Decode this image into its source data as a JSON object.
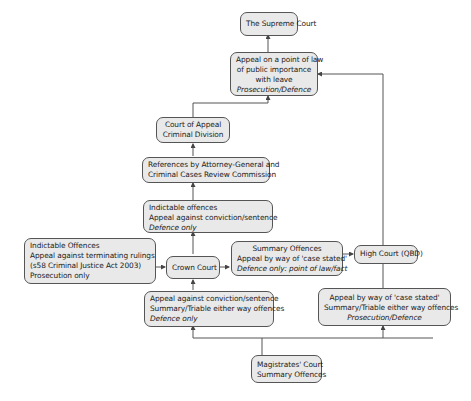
{
  "diagram": {
    "nodes": {
      "supreme_court": {
        "lines": [
          "The Supreme Court"
        ]
      },
      "point_of_law": {
        "lines": [
          "Appeal on a point of law",
          "of public importance",
          "with leave"
        ],
        "italic": "Prosecution/Defence"
      },
      "court_of_appeal": {
        "lines": [
          "Court of Appeal",
          "Criminal Division"
        ]
      },
      "references": {
        "lines": [
          "References by Attorney-General and",
          "Criminal Cases Review Commission"
        ]
      },
      "indictable_appeal": {
        "lines": [
          "Indictable offences",
          "Appeal against conviction/sentence"
        ],
        "italic": "Defence only"
      },
      "terminating_rulings": {
        "lines": [
          "Indictable Offences",
          "Appeal against terminating rulings",
          "(s58 Criminal Justice Act 2003)",
          "Prosecution only"
        ]
      },
      "crown_court": {
        "lines": [
          "Crown Court"
        ]
      },
      "summary_case_stated": {
        "lines": [
          "Summary Offences",
          "Appeal by way of 'case stated'"
        ],
        "italic": "Defence only: point of law/fact"
      },
      "high_court": {
        "lines": [
          "High Court (QBD)"
        ]
      },
      "conviction_sentence": {
        "lines": [
          "Appeal against conviction/sentence",
          "Summary/Triable either way offences"
        ],
        "italic": "Defence only"
      },
      "case_stated_either_way": {
        "lines": [
          "Appeal by way of 'case stated'",
          "Summary/Triable either way offences"
        ],
        "italic": "Prosecution/Defence"
      },
      "magistrates_court": {
        "lines": [
          "Magistrates' Court",
          "Summary Offences"
        ]
      }
    },
    "edges": [
      {
        "from": "point_of_law",
        "to": "supreme_court"
      },
      {
        "from": "court_of_appeal",
        "to": "point_of_law"
      },
      {
        "from": "high_court",
        "to": "point_of_law"
      },
      {
        "from": "references",
        "to": "court_of_appeal"
      },
      {
        "from": "indictable_appeal",
        "to": "references"
      },
      {
        "from": "crown_court",
        "to": "indictable_appeal"
      },
      {
        "from": "terminating_rulings",
        "to": "crown_court"
      },
      {
        "from": "crown_court",
        "to": "summary_case_stated"
      },
      {
        "from": "summary_case_stated",
        "to": "high_court"
      },
      {
        "from": "conviction_sentence",
        "to": "crown_court"
      },
      {
        "from": "magistrates_court",
        "to": "conviction_sentence"
      },
      {
        "from": "magistrates_court",
        "to": "case_stated_either_way"
      },
      {
        "from": "case_stated_either_way",
        "to": "high_court"
      }
    ],
    "colors": {
      "box_fill": "#e9e9e9",
      "box_border": "#555555",
      "line": "#555555"
    }
  }
}
